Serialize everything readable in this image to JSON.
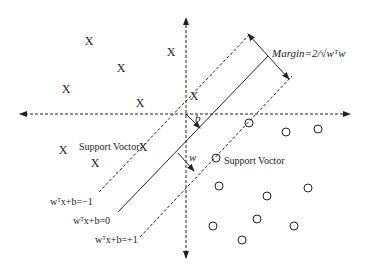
{
  "diagram": {
    "labels": {
      "margin": "Margin=2/√wᵀw",
      "b": "b",
      "w": "w",
      "support_vector_left": "Support Voctor",
      "support_vector_right": "Support Voctor",
      "plane_neg": "wᵀx+b=−1",
      "plane_zero": "wᵀx+b=0",
      "plane_pos": "wᵀx+b=+1"
    },
    "class_x_points": [
      [
        89,
        41
      ],
      [
        171,
        52
      ],
      [
        121,
        68
      ],
      [
        66,
        89
      ],
      [
        140,
        103
      ],
      [
        194,
        96
      ],
      [
        63,
        150
      ],
      [
        95,
        163
      ],
      [
        143,
        147
      ]
    ],
    "class_o_points": [
      [
        249,
        123
      ],
      [
        286,
        132
      ],
      [
        318,
        129
      ],
      [
        216,
        158
      ],
      [
        219,
        186
      ],
      [
        267,
        196
      ],
      [
        308,
        188
      ],
      [
        213,
        226
      ],
      [
        257,
        219
      ],
      [
        294,
        226
      ],
      [
        242,
        240
      ]
    ],
    "colors": {
      "stroke": "#222222",
      "background": "#ffffff"
    }
  }
}
